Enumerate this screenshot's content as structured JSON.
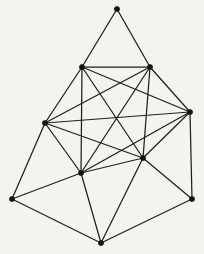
{
  "figure": {
    "kind": "node-link-diagram",
    "width": 204,
    "height": 254,
    "background_color": "#f5f3ef",
    "edge_color": "#211f1e",
    "vertex_color": "#141211",
    "edge_width": 1.25,
    "vertex_radius": 2.6,
    "vertex_count": 10,
    "edge_count": 24
  },
  "chart_data": {
    "type": "diagram",
    "xlabel": "",
    "ylabel": "",
    "xlim": [
      0,
      204
    ],
    "ylim": [
      0,
      254
    ],
    "grid": false,
    "legend": "none",
    "nodes": [
      {
        "id": "apex",
        "label": "",
        "x": 117,
        "y": 9
      },
      {
        "id": "upper-left",
        "label": "",
        "x": 82,
        "y": 67
      },
      {
        "id": "upper-right",
        "label": "",
        "x": 150,
        "y": 67
      },
      {
        "id": "mid-left",
        "label": "",
        "x": 45,
        "y": 123
      },
      {
        "id": "mid-right",
        "label": "",
        "x": 190,
        "y": 112
      },
      {
        "id": "inner-right",
        "label": "",
        "x": 143,
        "y": 158
      },
      {
        "id": "inner-left",
        "label": "",
        "x": 81,
        "y": 173
      },
      {
        "id": "bottom-left",
        "label": "",
        "x": 12,
        "y": 199
      },
      {
        "id": "bottom-right",
        "label": "",
        "x": 192,
        "y": 199
      },
      {
        "id": "bottom-mid",
        "label": "",
        "x": 101,
        "y": 243
      }
    ],
    "edges": [
      {
        "from": "apex",
        "to": "upper-left"
      },
      {
        "from": "apex",
        "to": "upper-right"
      },
      {
        "from": "upper-left",
        "to": "upper-right"
      },
      {
        "from": "upper-left",
        "to": "mid-left"
      },
      {
        "from": "upper-left",
        "to": "mid-right"
      },
      {
        "from": "upper-left",
        "to": "inner-left"
      },
      {
        "from": "upper-left",
        "to": "inner-right"
      },
      {
        "from": "upper-right",
        "to": "mid-left"
      },
      {
        "from": "upper-right",
        "to": "mid-right"
      },
      {
        "from": "upper-right",
        "to": "inner-left"
      },
      {
        "from": "upper-right",
        "to": "inner-right"
      },
      {
        "from": "mid-left",
        "to": "mid-right"
      },
      {
        "from": "mid-left",
        "to": "inner-left"
      },
      {
        "from": "mid-left",
        "to": "inner-right"
      },
      {
        "from": "mid-left",
        "to": "bottom-left"
      },
      {
        "from": "mid-right",
        "to": "inner-left"
      },
      {
        "from": "mid-right",
        "to": "inner-right"
      },
      {
        "from": "mid-right",
        "to": "bottom-right"
      },
      {
        "from": "inner-left",
        "to": "inner-right"
      },
      {
        "from": "inner-left",
        "to": "bottom-left"
      },
      {
        "from": "inner-left",
        "to": "bottom-mid"
      },
      {
        "from": "inner-right",
        "to": "bottom-mid"
      },
      {
        "from": "inner-right",
        "to": "bottom-right"
      },
      {
        "from": "bottom-left",
        "to": "bottom-mid"
      },
      {
        "from": "bottom-mid",
        "to": "bottom-right"
      }
    ]
  }
}
